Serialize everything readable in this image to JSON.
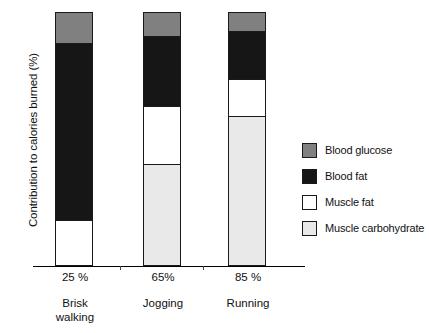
{
  "chart_data": {
    "type": "bar",
    "subtype": "stacked-bar-100",
    "title": "",
    "xlabel": "",
    "ylabel": "Contribution to calories burned (%)",
    "ylim": [
      0,
      100
    ],
    "grid": false,
    "legend_position": "right",
    "categories": [
      "Brisk walking",
      "Jogging",
      "Running"
    ],
    "category_intensity": [
      "25 %",
      "65%",
      "85 %"
    ],
    "series": [
      {
        "name": "Muscle carbohydrate",
        "color": "#e9e9e9",
        "values": [
          0,
          40,
          59
        ]
      },
      {
        "name": "Muscle fat",
        "color": "#ffffff",
        "values": [
          18,
          23,
          15
        ]
      },
      {
        "name": "Blood fat",
        "color": "#161616",
        "values": [
          70,
          28,
          19
        ]
      },
      {
        "name": "Blood glucose",
        "color": "#808080",
        "values": [
          12,
          9,
          7
        ]
      }
    ],
    "stack_order_bottom_to_top": [
      "Muscle carbohydrate",
      "Muscle fat",
      "Blood fat",
      "Blood glucose"
    ]
  },
  "axis": {
    "y_title": "Contribution to calories burned (%)",
    "x_groups": [
      {
        "percent": "25 %",
        "name_line1": "Brisk",
        "name_line2": "walking"
      },
      {
        "percent": "65%",
        "name_line1": "Jogging",
        "name_line2": ""
      },
      {
        "percent": "85 %",
        "name_line1": "Running",
        "name_line2": ""
      }
    ]
  },
  "legend": {
    "items": [
      {
        "label": "Blood glucose",
        "color": "#808080"
      },
      {
        "label": "Blood fat",
        "color": "#161616"
      },
      {
        "label": "Muscle fat",
        "color": "#ffffff"
      },
      {
        "label": "Muscle carbohydrate",
        "color": "#e9e9e9"
      }
    ]
  },
  "colors": {
    "blood_glucose": "#808080",
    "blood_fat": "#161616",
    "muscle_fat": "#ffffff",
    "muscle_carbohydrate": "#e9e9e9",
    "outline": "#1a1a1a",
    "axis": "#000000",
    "background": "#ffffff"
  }
}
